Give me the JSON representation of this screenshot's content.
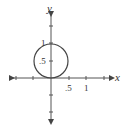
{
  "diagram": {
    "type": "coordinate-plane",
    "axes": {
      "x_label": "x",
      "y_label": "y",
      "x_tick_labels": [
        ".5",
        "1"
      ],
      "y_tick_labels": [
        ".5",
        "1"
      ]
    },
    "shape": {
      "kind": "circle",
      "center": [
        0,
        0.5
      ],
      "radius": 0.5
    },
    "colors": {
      "stroke": "#444444",
      "background": "#ffffff"
    }
  }
}
